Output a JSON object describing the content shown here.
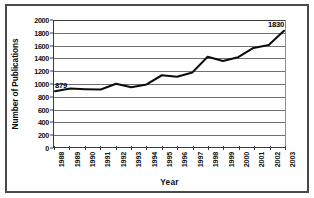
{
  "chart_data": {
    "type": "line",
    "title": "",
    "xlabel": "Year",
    "ylabel": "Number of Publications",
    "categories": [
      "1988",
      "1989",
      "1990",
      "1991",
      "1992",
      "1993",
      "1994",
      "1995",
      "1996",
      "1997",
      "1998",
      "1999",
      "2000",
      "2001",
      "2002",
      "2003"
    ],
    "values": [
      879,
      920,
      910,
      905,
      995,
      940,
      985,
      1130,
      1105,
      1175,
      1420,
      1355,
      1415,
      1560,
      1605,
      1830
    ],
    "series": [
      {
        "name": "Number of Publications",
        "values": [
          879,
          920,
          910,
          905,
          995,
          940,
          985,
          1130,
          1105,
          1175,
          1420,
          1355,
          1415,
          1560,
          1605,
          1830
        ]
      }
    ],
    "ylim": [
      0,
      2000
    ],
    "yticks": [
      0,
      200,
      400,
      600,
      800,
      1000,
      1200,
      1400,
      1600,
      1800,
      2000
    ],
    "ytick_labels": [
      "0",
      "200",
      "400",
      "600",
      "800",
      "1000",
      "1200",
      "1400",
      "1600",
      "1800",
      "2000"
    ],
    "grid": "horizontal",
    "legend": "none",
    "annotations": [
      {
        "text": "879",
        "category": "1988",
        "value": 879
      },
      {
        "text": "1830",
        "category": "2003",
        "value": 1830
      }
    ],
    "colors": {
      "line": "#0d0d0d",
      "gridline": "#6f6f6f",
      "axis": "#3a3a3a",
      "frame": "#4a4a4a",
      "background": "#ffffff",
      "text": "#0d0d0d"
    }
  }
}
